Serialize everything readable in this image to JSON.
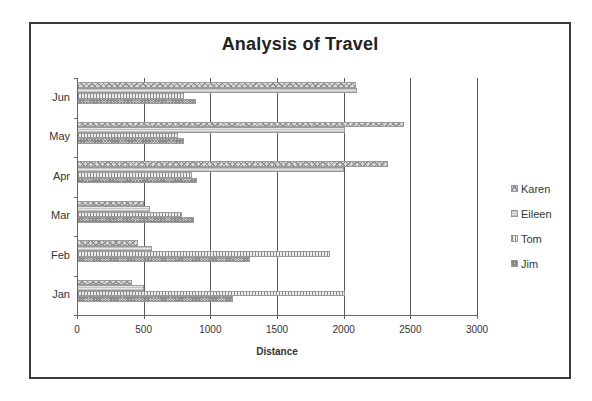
{
  "chart_data": {
    "type": "bar",
    "orientation": "horizontal",
    "title": "Analysis of Travel",
    "xlabel": "Distance",
    "ylabel": "",
    "xlim": [
      0,
      3000
    ],
    "x_ticks": [
      "0",
      "500",
      "1000",
      "1500",
      "2000",
      "2500",
      "3000"
    ],
    "categories": [
      "Jan",
      "Feb",
      "Mar",
      "Apr",
      "May",
      "Jun"
    ],
    "series": [
      {
        "name": "Karen",
        "values": [
          410,
          460,
          500,
          2330,
          2450,
          2090
        ]
      },
      {
        "name": "Eileen",
        "values": [
          500,
          560,
          550,
          2000,
          2010,
          2100
        ]
      },
      {
        "name": "Tom",
        "values": [
          2010,
          1900,
          790,
          860,
          760,
          800
        ]
      },
      {
        "name": "Jim",
        "values": [
          1170,
          1300,
          880,
          900,
          800,
          890
        ]
      }
    ],
    "grid": {
      "vertical": true,
      "horizontal": false
    },
    "legend_position": "right",
    "colors": {
      "Karen": "#b0b0b0",
      "Eileen": "#e0e0e0",
      "Tom": "#c8c8c8",
      "Jim": "#a8a8a8"
    }
  },
  "legend": {
    "items": [
      {
        "label": "Karen"
      },
      {
        "label": "Eileen"
      },
      {
        "label": "Tom"
      },
      {
        "label": "Jim"
      }
    ]
  }
}
